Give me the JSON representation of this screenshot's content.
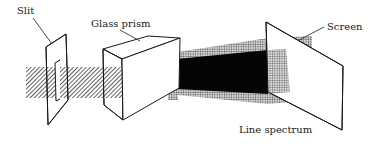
{
  "diagram": {
    "labels": {
      "slit": "Slit",
      "prism": "Glass prism",
      "screen": "Screen",
      "spectrum": "Line spectrum"
    },
    "components": [
      {
        "id": "slit",
        "name": "Slit"
      },
      {
        "id": "prism",
        "name": "Glass prism"
      },
      {
        "id": "screen",
        "name": "Screen"
      },
      {
        "id": "spectrum",
        "name": "Line spectrum"
      }
    ],
    "colors": {
      "line": "#1a1a1a",
      "beam_hatch": "#333333",
      "spectrum_dark": "#050505",
      "spectrum_halftone": "#8a8a8a",
      "background": "#ffffff"
    }
  }
}
